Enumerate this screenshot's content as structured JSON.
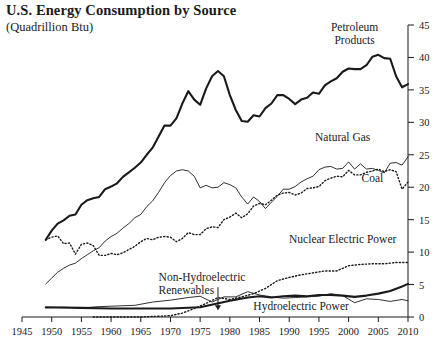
{
  "chart_data": {
    "type": "line",
    "title": "U.S. Energy Consumption by Source",
    "subtitle": "(Quadrillion Btu)",
    "ylabel": "Quadrillion Btu",
    "xlabel": "",
    "xlim": [
      1945,
      2010
    ],
    "ylim": [
      0,
      45
    ],
    "yticks": [
      0,
      5,
      10,
      15,
      20,
      25,
      30,
      35,
      40,
      45
    ],
    "xticks": [
      1945,
      1950,
      1955,
      1960,
      1965,
      1970,
      1975,
      1980,
      1985,
      1990,
      1995,
      2000,
      2005,
      2010
    ],
    "grid": false,
    "legend": "inline-annotations",
    "y_axis_position": "right",
    "series": [
      {
        "name": "Petroleum Products",
        "style": "thick-solid",
        "label_x": 2001,
        "label_y": 44.0,
        "x": [
          1949,
          1950,
          1951,
          1952,
          1953,
          1954,
          1955,
          1956,
          1957,
          1958,
          1959,
          1960,
          1961,
          1962,
          1963,
          1964,
          1965,
          1966,
          1967,
          1968,
          1969,
          1970,
          1971,
          1972,
          1973,
          1974,
          1975,
          1976,
          1977,
          1978,
          1979,
          1980,
          1981,
          1982,
          1983,
          1984,
          1985,
          1986,
          1987,
          1988,
          1989,
          1990,
          1991,
          1992,
          1993,
          1994,
          1995,
          1996,
          1997,
          1998,
          1999,
          2000,
          2001,
          2002,
          2003,
          2004,
          2005,
          2006,
          2007,
          2008,
          2009,
          2010
        ],
        "values": [
          11.9,
          13.3,
          14.4,
          14.9,
          15.6,
          15.8,
          17.3,
          18.0,
          18.3,
          18.5,
          19.7,
          20.1,
          20.6,
          21.6,
          22.3,
          23.0,
          23.8,
          25.0,
          26.1,
          27.8,
          29.5,
          29.5,
          30.6,
          32.9,
          34.8,
          33.5,
          32.7,
          35.2,
          37.1,
          37.9,
          37.1,
          34.2,
          31.9,
          30.2,
          30.1,
          31.1,
          30.9,
          32.2,
          32.9,
          34.2,
          34.2,
          33.6,
          32.8,
          33.5,
          33.8,
          34.6,
          34.4,
          35.7,
          36.3,
          36.8,
          37.8,
          38.3,
          38.2,
          38.2,
          38.8,
          40.1,
          40.4,
          39.9,
          39.8,
          37.1,
          35.4,
          35.9
        ]
      },
      {
        "name": "Natural Gas",
        "style": "thin-solid",
        "label_x": 1999,
        "label_y": 27.2,
        "x": [
          1949,
          1950,
          1951,
          1952,
          1953,
          1954,
          1955,
          1956,
          1957,
          1958,
          1959,
          1960,
          1961,
          1962,
          1963,
          1964,
          1965,
          1966,
          1967,
          1968,
          1969,
          1970,
          1971,
          1972,
          1973,
          1974,
          1975,
          1976,
          1977,
          1978,
          1979,
          1980,
          1981,
          1982,
          1983,
          1984,
          1985,
          1986,
          1987,
          1988,
          1989,
          1990,
          1991,
          1992,
          1993,
          1994,
          1995,
          1996,
          1997,
          1998,
          1999,
          2000,
          2001,
          2002,
          2003,
          2004,
          2005,
          2006,
          2007,
          2008,
          2009,
          2010
        ],
        "values": [
          5.1,
          6.0,
          6.9,
          7.5,
          8.0,
          8.3,
          9.0,
          9.6,
          10.2,
          10.7,
          11.7,
          12.4,
          12.9,
          13.7,
          14.4,
          15.3,
          15.8,
          17.0,
          17.9,
          19.2,
          20.7,
          21.8,
          22.5,
          22.7,
          22.5,
          21.7,
          19.9,
          20.3,
          19.9,
          20.0,
          20.7,
          20.4,
          19.9,
          18.5,
          17.4,
          18.5,
          17.8,
          16.7,
          17.7,
          18.6,
          19.7,
          19.7,
          20.1,
          20.8,
          21.3,
          21.7,
          22.7,
          23.1,
          23.2,
          22.8,
          22.9,
          23.9,
          22.8,
          23.6,
          22.8,
          22.9,
          22.6,
          22.2,
          23.7,
          23.8,
          23.4,
          24.7
        ]
      },
      {
        "name": "Coal",
        "style": "dotted",
        "label_x": 2004,
        "label_y": 20.8,
        "x": [
          1949,
          1950,
          1951,
          1952,
          1953,
          1954,
          1955,
          1956,
          1957,
          1958,
          1959,
          1960,
          1961,
          1962,
          1963,
          1964,
          1965,
          1966,
          1967,
          1968,
          1969,
          1970,
          1971,
          1972,
          1973,
          1974,
          1975,
          1976,
          1977,
          1978,
          1979,
          1980,
          1981,
          1982,
          1983,
          1984,
          1985,
          1986,
          1987,
          1988,
          1989,
          1990,
          1991,
          1992,
          1993,
          1994,
          1995,
          1996,
          1997,
          1998,
          1999,
          2000,
          2001,
          2002,
          2003,
          2004,
          2005,
          2006,
          2007,
          2008,
          2009,
          2010
        ],
        "values": [
          11.9,
          12.3,
          12.5,
          11.3,
          11.4,
          9.7,
          11.2,
          11.4,
          11.0,
          9.5,
          9.5,
          9.8,
          9.6,
          9.9,
          10.4,
          10.9,
          11.6,
          12.1,
          11.9,
          12.3,
          12.4,
          12.3,
          11.6,
          12.1,
          13.0,
          12.7,
          12.7,
          13.6,
          13.9,
          13.8,
          15.0,
          15.4,
          16.0,
          15.3,
          15.9,
          17.1,
          17.5,
          17.3,
          18.0,
          18.8,
          19.1,
          19.2,
          18.8,
          19.1,
          19.8,
          19.9,
          20.1,
          21.0,
          21.4,
          21.7,
          21.6,
          22.6,
          21.9,
          21.9,
          22.3,
          22.5,
          22.8,
          22.4,
          22.7,
          22.4,
          19.7,
          20.8
        ]
      },
      {
        "name": "Nuclear Electric Power",
        "style": "dotted",
        "label_x": 1999,
        "label_y": 11.4,
        "x": [
          1957,
          1960,
          1965,
          1970,
          1972,
          1974,
          1976,
          1978,
          1980,
          1982,
          1984,
          1986,
          1988,
          1990,
          1992,
          1994,
          1996,
          1998,
          2000,
          2002,
          2004,
          2006,
          2008,
          2010
        ],
        "values": [
          0.0,
          0.0,
          0.0,
          0.2,
          0.6,
          1.3,
          2.1,
          3.0,
          2.7,
          3.1,
          3.6,
          4.4,
          5.6,
          6.1,
          6.5,
          6.8,
          7.1,
          7.1,
          7.9,
          8.1,
          8.2,
          8.2,
          8.4,
          8.4
        ]
      },
      {
        "name": "Hydroelectric Power",
        "style": "thin-solid",
        "label_x": 1992,
        "label_y": 1.1,
        "x": [
          1949,
          1952,
          1955,
          1958,
          1961,
          1964,
          1967,
          1970,
          1973,
          1975,
          1977,
          1979,
          1981,
          1983,
          1985,
          1987,
          1989,
          1991,
          1993,
          1995,
          1997,
          1999,
          2001,
          2003,
          2005,
          2007,
          2009,
          2010
        ],
        "values": [
          1.4,
          1.5,
          1.4,
          1.6,
          1.7,
          1.8,
          2.3,
          2.6,
          3.0,
          3.2,
          2.3,
          3.1,
          3.1,
          3.9,
          3.4,
          3.1,
          2.9,
          3.0,
          3.1,
          3.2,
          3.6,
          3.3,
          2.2,
          2.8,
          2.7,
          2.4,
          2.7,
          2.5
        ]
      },
      {
        "name": "Non-Hydroelectric Renewables",
        "style": "thick-solid",
        "label_x": 1968,
        "label_y": 5.6,
        "arrow_x": 1978,
        "arrow_y_top": 4.6,
        "arrow_y_bottom": 1.1,
        "x": [
          1949,
          1955,
          1960,
          1965,
          1970,
          1975,
          1980,
          1983,
          1985,
          1987,
          1989,
          1991,
          1993,
          1995,
          1997,
          1999,
          2001,
          2003,
          2005,
          2007,
          2009,
          2010
        ],
        "values": [
          1.5,
          1.4,
          1.3,
          1.3,
          1.3,
          1.5,
          2.5,
          3.0,
          3.2,
          3.0,
          3.2,
          3.3,
          3.2,
          3.4,
          3.4,
          3.3,
          3.1,
          3.3,
          3.6,
          4.0,
          4.7,
          5.1
        ]
      }
    ]
  }
}
